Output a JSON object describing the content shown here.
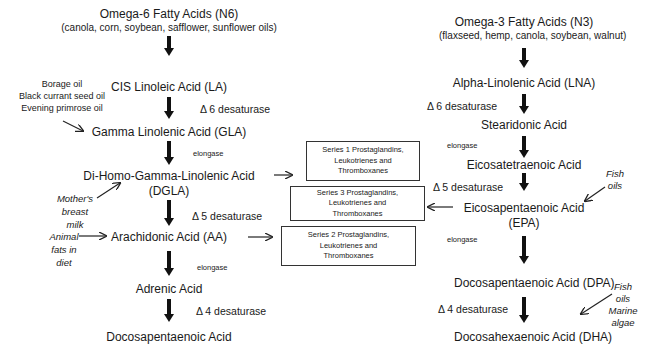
{
  "omega6": {
    "title": "Omega-6 Fatty Acids (N6)",
    "sources": "(canola, corn, soybean, safflower, sunflower oils)",
    "steps": [
      {
        "name": "CIS Linoleic Acid (LA)"
      },
      {
        "name": "Gamma Linolenic Acid (GLA)"
      },
      {
        "name": "Di-Homo-Gamma-Linolenic Acid",
        "name2": "(DGLA)"
      },
      {
        "name": "Arachidonic Acid (AA)"
      },
      {
        "name": "Adrenic Acid"
      },
      {
        "name": "Docosapentaenoic Acid"
      }
    ],
    "enzymes": [
      "Δ 6 desaturase",
      "elongase",
      "Δ 5 desaturase",
      "elongase",
      "Δ 4 desaturase"
    ],
    "external_sources": {
      "gla": [
        "Borage oil",
        "Black currant seed oil",
        "Evening primrose oil"
      ],
      "dgla": [
        "Mother's",
        "breast",
        "milk"
      ],
      "aa": [
        "Animal",
        "fats in",
        "diet"
      ]
    }
  },
  "omega3": {
    "title": "Omega-3 Fatty Acids (N3)",
    "sources": "(flaxseed, hemp, canola, soybean, walnut)",
    "steps": [
      {
        "name": "Alpha-Linolenic Acid (LNA)"
      },
      {
        "name": "Stearidonic Acid"
      },
      {
        "name": "Eicosatetraenoic Acid"
      },
      {
        "name": "Eicosapentaenoic Acid",
        "name2": "(EPA)"
      },
      {
        "name": "Docosapentaenoic Acid (DPA)"
      },
      {
        "name": "Docosahexaenoic Acid (DHA)"
      }
    ],
    "enzymes": [
      "Δ 6 desaturase",
      "elongase",
      "Δ 5 desaturase",
      "elongase",
      "Δ 4 desaturase"
    ],
    "external_sources": {
      "epa": [
        "Fish",
        "oils"
      ],
      "dha": [
        "Fish",
        "oils",
        "Marine",
        "algae"
      ]
    }
  },
  "products": [
    {
      "lines": [
        "Series 1 Prostaglandins,",
        "Leukotrienes and",
        "Thromboxanes"
      ]
    },
    {
      "lines": [
        "Series 3 Prostaglandins,",
        "Leukotrienes and",
        "Thromboxanes"
      ]
    },
    {
      "lines": [
        "Series 2 Prostaglandins,",
        "Leukotrienes and",
        "Thromboxanes"
      ]
    }
  ]
}
